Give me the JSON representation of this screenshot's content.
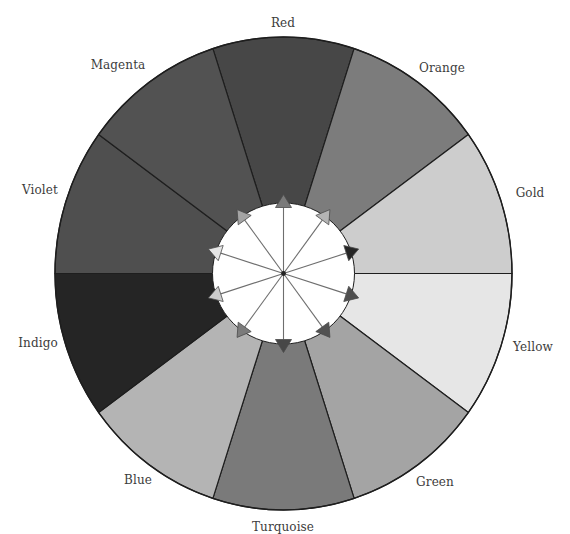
{
  "diagram": {
    "center": {
      "x": 283.5,
      "y": 273.5
    },
    "outer_radius": {
      "rx": 228.5,
      "ry": 236.5
    },
    "inner_radius": {
      "rx": 71,
      "ry": 70.5
    },
    "arrow_length": {
      "rx": 79,
      "ry": 79
    },
    "segment_span_deg": 36,
    "outline_color": "#1e1e1e",
    "arrow_line_color": "#6e6e6e",
    "center_dot_color": "#222222",
    "segments": [
      {
        "name": "Red",
        "center_deg": -90,
        "fill": "#474747",
        "label_x": 283,
        "label_y": 23
      },
      {
        "name": "Orange",
        "center_deg": -54,
        "fill": "#7c7c7c",
        "label_x": 442,
        "label_y": 68
      },
      {
        "name": "Gold",
        "center_deg": -18,
        "fill": "#cdcdcd",
        "label_x": 530,
        "label_y": 193
      },
      {
        "name": "Yellow",
        "center_deg": 18,
        "fill": "#e6e6e6",
        "label_x": 533,
        "label_y": 347
      },
      {
        "name": "Green",
        "center_deg": 54,
        "fill": "#a4a4a4",
        "label_x": 435,
        "label_y": 482
      },
      {
        "name": "Turquoise",
        "center_deg": 90,
        "fill": "#7a7a7a",
        "label_x": 283,
        "label_y": 527
      },
      {
        "name": "Blue",
        "center_deg": 126,
        "fill": "#b4b4b4",
        "label_x": 138,
        "label_y": 480
      },
      {
        "name": "Indigo",
        "center_deg": 162,
        "fill": "#252525",
        "label_x": 38,
        "label_y": 343
      },
      {
        "name": "Violet",
        "center_deg": 198,
        "fill": "#4f4f4f",
        "label_x": 40,
        "label_y": 190
      },
      {
        "name": "Magenta",
        "center_deg": 234,
        "fill": "#525252",
        "label_x": 118,
        "label_y": 65
      }
    ],
    "arrows": [
      {
        "target": "Red",
        "head_color_from": "Turquoise"
      },
      {
        "target": "Orange",
        "head_color_from": "Blue"
      },
      {
        "target": "Gold",
        "head_color_from": "Indigo"
      },
      {
        "target": "Yellow",
        "head_color_from": "Violet"
      },
      {
        "target": "Green",
        "head_color_from": "Magenta"
      },
      {
        "target": "Turquoise",
        "head_color_from": "Red"
      },
      {
        "target": "Blue",
        "head_color_from": "Orange"
      },
      {
        "target": "Indigo",
        "head_color_from": "Gold"
      },
      {
        "target": "Violet",
        "head_color_from": "Yellow"
      },
      {
        "target": "Magenta",
        "head_color_from": "Green"
      }
    ]
  }
}
